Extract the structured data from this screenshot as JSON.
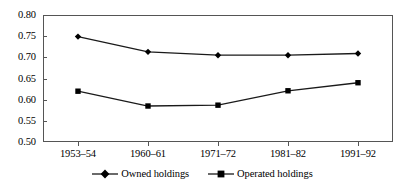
{
  "chart_data": {
    "type": "line",
    "title": "",
    "subtitle": "",
    "xlabel": "",
    "ylabel": "",
    "categories": [
      "1953–54",
      "1960–61",
      "1971–72",
      "1981–82",
      "1991–92"
    ],
    "series": [
      {
        "name": "Owned holdings",
        "marker": "diamond",
        "color": "#000000",
        "values": [
          0.749,
          0.713,
          0.705,
          0.705,
          0.709
        ]
      },
      {
        "name": "Operated holdings",
        "marker": "square",
        "color": "#000000",
        "values": [
          0.62,
          0.585,
          0.587,
          0.621,
          0.64
        ]
      }
    ],
    "ylim": [
      0.5,
      0.8
    ],
    "yticks": [
      "0.80",
      "0.75",
      "0.70",
      "0.65",
      "0.60",
      "0.55",
      "0.50"
    ],
    "ytick_values": [
      0.8,
      0.75,
      0.7,
      0.65,
      0.6,
      0.55,
      0.5
    ],
    "grid": false,
    "legend_position": "bottom"
  },
  "axes": {
    "y_tick_labels": [
      "0.80",
      "0.75",
      "0.70",
      "0.65",
      "0.60",
      "0.55",
      "0.50"
    ],
    "x_tick_labels": [
      "1953–54",
      "1960–61",
      "1971–72",
      "1981–82",
      "1991–92"
    ]
  },
  "legend": {
    "entries": [
      {
        "label": "Owned holdings",
        "marker": "diamond-marker-icon"
      },
      {
        "label": "Operated holdings",
        "marker": "square-marker-icon"
      }
    ]
  },
  "colors": {
    "line": "#1a1a1a",
    "marker": "#000000",
    "frame": "#555555",
    "text": "#000000",
    "background": "#ffffff"
  }
}
